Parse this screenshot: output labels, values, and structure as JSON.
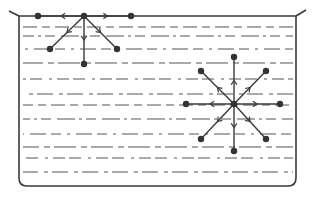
{
  "diagram": {
    "title": "",
    "colors": {
      "line": "#3a3a3a",
      "molecule": "#333333",
      "liquid_lines": "#555555",
      "background": "#ffffff"
    },
    "container": {
      "left": 19,
      "right": 296,
      "top": 16,
      "bottom": 186,
      "corner_radius": 8,
      "lip_left": [
        [
          9,
          11
        ],
        [
          19,
          16
        ]
      ],
      "lip_right": [
        [
          296,
          16
        ],
        [
          306,
          10
        ]
      ]
    },
    "liquid_line_rows": [
      27,
      36,
      49,
      63,
      79,
      94,
      105,
      119,
      134,
      147,
      158,
      172
    ],
    "surface_molecule": {
      "label": "surface-molecule",
      "center": [
        84,
        16
      ],
      "neighbors": [
        [
          38,
          16
        ],
        [
          131,
          16
        ],
        [
          50,
          49
        ],
        [
          117,
          49
        ],
        [
          84,
          64
        ]
      ]
    },
    "interior_molecule": {
      "label": "interior-molecule",
      "center": [
        234,
        104
      ],
      "neighbors": [
        [
          234,
          57
        ],
        [
          234,
          151
        ],
        [
          186,
          104
        ],
        [
          280,
          104
        ],
        [
          201,
          71
        ],
        [
          266,
          71
        ],
        [
          201,
          139
        ],
        [
          266,
          139
        ]
      ]
    }
  }
}
